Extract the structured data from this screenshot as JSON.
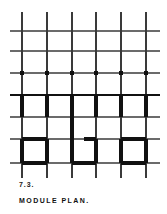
{
  "figure": {
    "number_label": "7.3.",
    "title_label": "MODULE PLAN.",
    "background_color": "#ffffff",
    "thin_line_color": "#6b6b6b",
    "medium_line_color": "#3a3a3a",
    "thick_line_color": "#111111",
    "dot_color": "#111111"
  },
  "plan": {
    "type": "architectural-module-grid",
    "grid": {
      "vertical_line_x": [
        22,
        47,
        72,
        96,
        121,
        146
      ],
      "horizontal_line_y": [
        31,
        51,
        73,
        95,
        117,
        139,
        163
      ],
      "vertical_extent": {
        "y_top": 12,
        "y_bottom": 178
      },
      "horizontal_extent": {
        "x_left": 10,
        "x_right": 160
      },
      "vertical_line_count": 6,
      "horizontal_line_count": 7,
      "thin_stroke_width": 1.1,
      "vertical_stroke_width": 1.3
    },
    "column_dots": {
      "row_y": 73,
      "x_positions": [
        22,
        47,
        72,
        96,
        121,
        146
      ],
      "radius": 2.1,
      "count": 6
    },
    "wall_band": {
      "label": "upper-wall-band",
      "y_top": 95,
      "y_bottom": 117,
      "stroke_width": 3.2,
      "segments_x": [
        22,
        47,
        72,
        96,
        121,
        146
      ]
    },
    "room_band": {
      "label": "lower-room-band",
      "y_top": 139,
      "y_bottom": 163,
      "stroke_width": 3.2,
      "rooms": [
        {
          "name": "room-left",
          "x_left": 22,
          "x_right": 47,
          "top_edge": "full"
        },
        {
          "name": "room-center",
          "x_left": 72,
          "x_right": 96,
          "top_edge": "partial-right"
        },
        {
          "name": "room-right",
          "x_left": 121,
          "x_right": 146,
          "top_edge": "full"
        }
      ],
      "center_room_partial_top_x_start": 84
    },
    "extra_verticals": [
      {
        "name": "thick-vertical-col3-upper",
        "x": 72,
        "y_top": 95,
        "y_bottom": 139
      }
    ]
  }
}
